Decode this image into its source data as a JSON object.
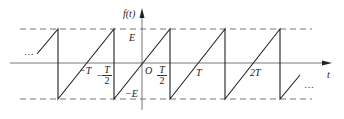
{
  "diagram": {
    "y_axis_label": "f(t)",
    "x_axis_label": "t",
    "origin_label": "O",
    "levels": {
      "upper": "E",
      "lower": "−E"
    },
    "tick_labels": {
      "neg_T": "−T",
      "neg_half_T_sign": "−",
      "neg_half_T_num": "T",
      "neg_half_T_den": "2",
      "half_T_num": "T",
      "half_T_den": "2",
      "T": "T",
      "two_T": "2T"
    },
    "continuation_left": "…",
    "continuation_right": "…",
    "colors": {
      "line": "#222222",
      "axis": "#555555",
      "dash": "#666666"
    }
  }
}
